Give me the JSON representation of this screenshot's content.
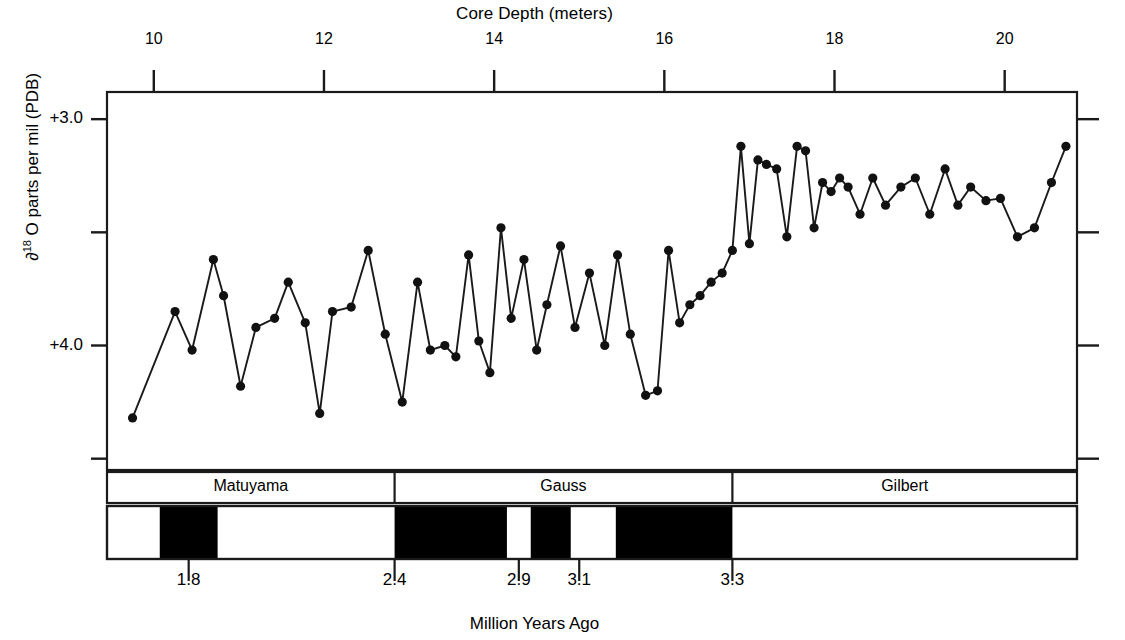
{
  "chart_data": {
    "type": "line",
    "title": "",
    "xlabel": "Million Years Ago",
    "xlabel_top": "Core Depth (meters)",
    "ylabel": "∂ 18 O parts per mil (PDB)",
    "ylabel_prefix": "∂",
    "ylabel_sup": "18",
    "ylabel_rest": " O parts per mil (PDB)",
    "grid": false,
    "legend": "none",
    "axis_top": {
      "name": "Core Depth (meters)",
      "ticks": [
        10,
        12,
        14,
        16,
        18,
        20
      ],
      "tick_labels": [
        "10",
        "12",
        "14",
        "16",
        "18",
        "20"
      ],
      "range": [
        9.45,
        20.85
      ]
    },
    "axis_left": {
      "name": "∂ 18O parts per mil (PDB)",
      "major_ticks": [
        3.0,
        4.0
      ],
      "major_tick_labels": [
        "+3.0",
        "+4.0"
      ],
      "minor_ticks": [
        3.5,
        4.5
      ],
      "ylim_top": 2.88,
      "ylim_bottom": 4.55,
      "inverted": true
    },
    "axis_bottom": {
      "name": "Million Years Ago",
      "ticks": [
        1.8,
        2.4,
        2.9,
        3.1,
        3.3
      ],
      "tick_labels": [
        "1.8",
        "2.4",
        "2.9",
        "3.1",
        "3.3"
      ]
    },
    "series": [
      {
        "name": "delta-18-O",
        "marker": "filled-circle",
        "x": [
          9.75,
          10.25,
          10.45,
          10.7,
          10.82,
          11.02,
          11.2,
          11.42,
          11.58,
          11.78,
          11.95,
          12.1,
          12.32,
          12.52,
          12.72,
          12.92,
          13.1,
          13.25,
          13.42,
          13.55,
          13.7,
          13.82,
          13.95,
          14.08,
          14.2,
          14.35,
          14.5,
          14.62,
          14.78,
          14.95,
          15.12,
          15.3,
          15.45,
          15.6,
          15.78,
          15.92,
          16.05,
          16.18,
          16.3,
          16.42,
          16.55,
          16.68,
          16.8,
          16.9,
          17.0,
          17.1,
          17.2,
          17.32,
          17.44,
          17.56,
          17.66,
          17.76,
          17.86,
          17.96,
          18.06,
          18.16,
          18.3,
          18.45,
          18.6,
          18.78,
          18.95,
          19.12,
          19.3,
          19.45,
          19.6,
          19.78,
          19.95,
          20.15,
          20.35,
          20.55,
          20.72
        ],
        "y": [
          4.32,
          3.85,
          4.02,
          3.62,
          3.78,
          4.18,
          3.92,
          3.88,
          3.72,
          3.9,
          4.3,
          3.85,
          3.83,
          3.58,
          3.95,
          4.25,
          3.72,
          4.02,
          4.0,
          4.05,
          3.6,
          3.98,
          4.12,
          3.48,
          3.88,
          3.62,
          4.02,
          3.82,
          3.56,
          3.92,
          3.68,
          4.0,
          3.6,
          3.95,
          4.22,
          4.2,
          3.58,
          3.9,
          3.82,
          3.78,
          3.72,
          3.68,
          3.58,
          3.12,
          3.55,
          3.18,
          3.2,
          3.22,
          3.52,
          3.12,
          3.14,
          3.48,
          3.28,
          3.32,
          3.26,
          3.3,
          3.42,
          3.26,
          3.38,
          3.3,
          3.26,
          3.42,
          3.22,
          3.38,
          3.3,
          3.36,
          3.35,
          3.52,
          3.48,
          3.28,
          3.12
        ]
      }
    ],
    "epochs": [
      {
        "label": "Matuyama",
        "start_depth": 9.45,
        "end_depth": 12.83
      },
      {
        "label": "Gauss",
        "start_depth": 12.83,
        "end_depth": 16.8
      },
      {
        "label": "Gilbert",
        "start_depth": 16.8,
        "end_depth": 20.85
      }
    ],
    "polarity_bands": [
      {
        "start_depth": 9.9,
        "end_depth": 12.0,
        "polarity": "normal",
        "color": "#ffffff"
      },
      {
        "start_depth": 10.07,
        "end_depth": 10.75,
        "polarity": "reversed",
        "color": "#000000"
      },
      {
        "start_depth": 12.83,
        "end_depth": 14.15,
        "polarity": "reversed",
        "color": "#000000"
      },
      {
        "start_depth": 14.43,
        "end_depth": 14.9,
        "polarity": "reversed",
        "color": "#000000"
      },
      {
        "start_depth": 15.43,
        "end_depth": 16.8,
        "polarity": "reversed",
        "color": "#000000"
      }
    ],
    "age_tick_depths": [
      10.41,
      12.83,
      14.29,
      15.0,
      16.8
    ]
  },
  "labels": {
    "top_axis_title": "Core Depth (meters)",
    "bottom_axis_title": "Million Years Ago",
    "y_axis_symbol": "∂",
    "y_axis_superscript": "18",
    "y_axis_text": " O parts per mil (PDB)",
    "top_ticks": [
      "10",
      "12",
      "14",
      "16",
      "18",
      "20"
    ],
    "y_ticks": [
      "+3.0",
      "+4.0"
    ],
    "bottom_ticks": [
      "1.8",
      "2.4",
      "2.9",
      "3.1",
      "3.3"
    ],
    "epoch_names": [
      "Matuyama",
      "Gauss",
      "Gilbert"
    ]
  },
  "colors": {
    "line": "#1a1a1a",
    "marker": "#111111",
    "axis": "#1a1a1a",
    "background": "#ffffff",
    "reversed_polarity": "#000000",
    "normal_polarity": "#ffffff"
  }
}
